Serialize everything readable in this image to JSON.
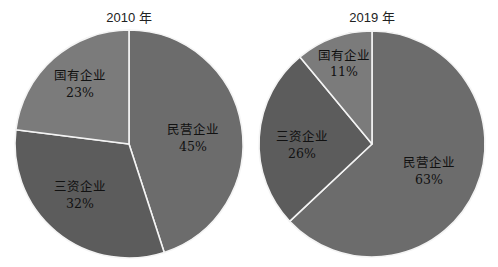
{
  "chart_data": [
    {
      "type": "pie",
      "title": "2010 年",
      "categories": [
        "民营企业",
        "三资企业",
        "国有企业"
      ],
      "values": [
        45,
        32,
        23
      ],
      "labels": [
        "45%",
        "32%",
        "23%"
      ],
      "colors": [
        "#6c6c6c",
        "#5c5c5c",
        "#7b7b7b"
      ],
      "start_angle": "12 o'clock, clockwise",
      "legend": "none (inline labels)"
    },
    {
      "type": "pie",
      "title": "2019 年",
      "categories": [
        "民营企业",
        "三资企业",
        "国有企业"
      ],
      "values": [
        63,
        26,
        11
      ],
      "labels": [
        "63%",
        "26%",
        "11%"
      ],
      "colors": [
        "#6c6c6c",
        "#5c5c5c",
        "#7b7b7b"
      ],
      "start_angle": "12 o'clock, clockwise",
      "legend": "none (inline labels)"
    }
  ],
  "charts": {
    "left": {
      "title": "2010 年",
      "slices": [
        {
          "name": "民营企业",
          "pct": "45%"
        },
        {
          "name": "三资企业",
          "pct": "32%"
        },
        {
          "name": "国有企业",
          "pct": "23%"
        }
      ]
    },
    "right": {
      "title": "2019 年",
      "slices": [
        {
          "name": "民营企业",
          "pct": "63%"
        },
        {
          "name": "三资企业",
          "pct": "26%"
        },
        {
          "name": "国有企业",
          "pct": "11%"
        }
      ]
    }
  }
}
